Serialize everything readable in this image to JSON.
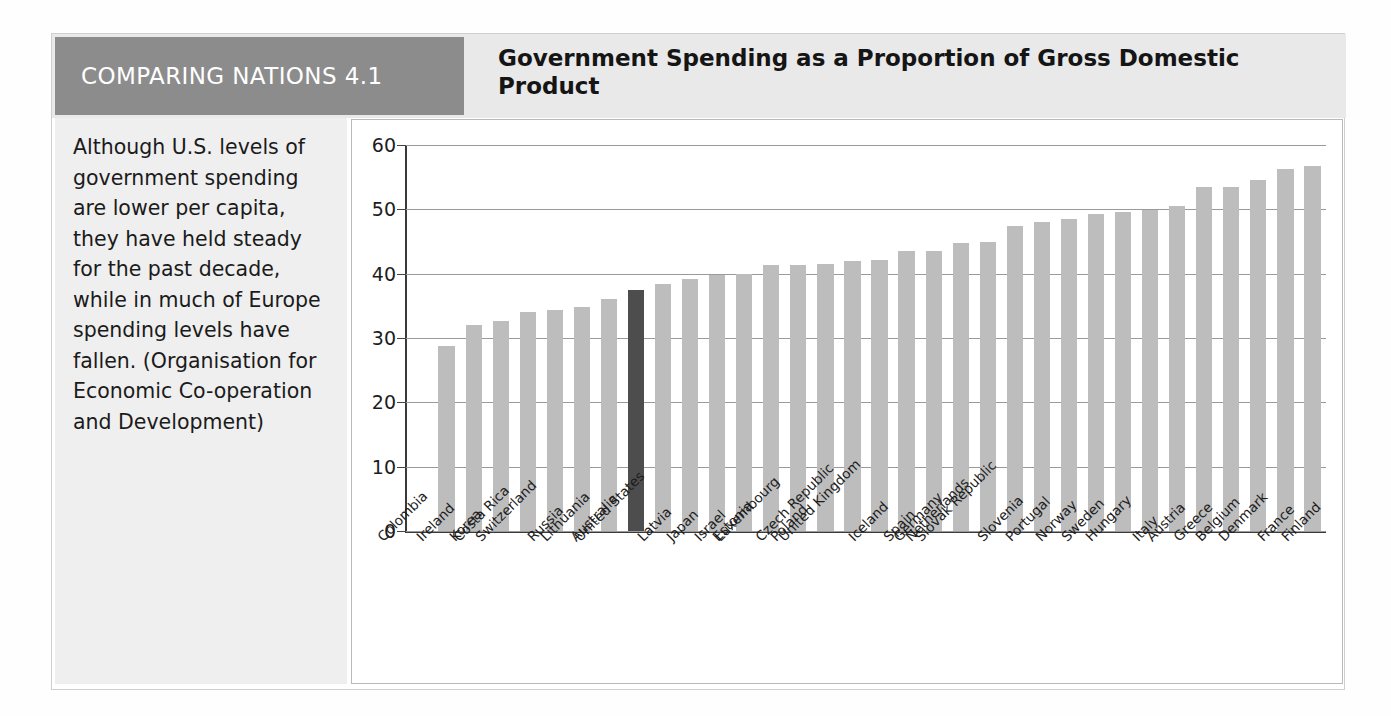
{
  "figure": {
    "tag_label": "COMPARING NATIONS 4.1",
    "title": "Government Spending as a Proportion of Gross Domestic Product",
    "caption": "Although U.S. levels of government spending are lower per capita, they have held steady for the past decade, while in much of Europe spending levels have fallen. (Organisation for Economic Co-operation and Development)",
    "colors": {
      "tag_background": "#8c8c8c",
      "header_background": "#e9e9e9",
      "sidebar_background": "#efefef",
      "bar": "#bdbdbd",
      "highlight_bar": "#4d4d4d",
      "axis": "#3a3a3a",
      "gridline": "#9a9a9a"
    }
  },
  "chart_data": {
    "type": "bar",
    "title": "Government Spending as a Proportion of Gross Domestic Product",
    "xlabel": "",
    "ylabel": "",
    "ylim": [
      0,
      60
    ],
    "yticks": [
      0,
      10,
      20,
      30,
      40,
      50,
      60
    ],
    "ytick_labels": [
      "0",
      "10",
      "20",
      "30",
      "40",
      "50",
      "60"
    ],
    "grid": true,
    "legend": "none",
    "highlight_category": "United States",
    "categories": [
      "Colombia",
      "Ireland",
      "Korea",
      "Costa Rica",
      "Switzerland",
      "Russia",
      "Lithuania",
      "Australia",
      "United States",
      "Latvia",
      "Japan",
      "Israel",
      "Estonia",
      "Luxembourg",
      "Poland",
      "Czech Republic",
      "United Kingdom",
      "Iceland",
      "Spain",
      "Germany",
      "Netherlands",
      "Slovak Republic",
      "Slovenia",
      "Portugal",
      "Norway",
      "Sweden",
      "Hungary",
      "Italy",
      "Austria",
      "Greece",
      "Belgium",
      "Denmark",
      "France",
      "Finland"
    ],
    "values": [
      null,
      28.8,
      32.1,
      32.6,
      34.0,
      34.3,
      34.8,
      36.1,
      37.4,
      38.4,
      39.1,
      39.8,
      40.0,
      41.3,
      41.3,
      41.5,
      41.9,
      42.1,
      43.6,
      43.6,
      44.7,
      45.0,
      47.4,
      48.1,
      48.5,
      49.3,
      49.6,
      49.9,
      50.5,
      53.5,
      53.5,
      54.5,
      56.3,
      56.8
    ],
    "units": "percent of GDP",
    "note": "First category (Colombia) has no bar drawn in the figure"
  }
}
